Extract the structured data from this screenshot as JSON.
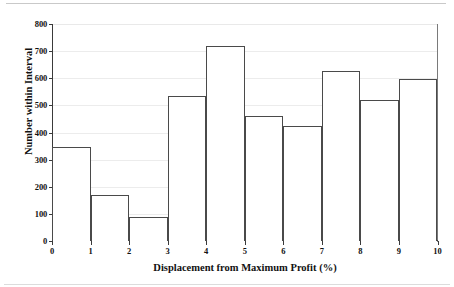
{
  "chart_data": {
    "type": "bar",
    "title": "",
    "subtitle": "",
    "xlabel": "Displacement from Maximum Profit (%)",
    "ylabel": "Number within Interval",
    "xlim": [
      0,
      10
    ],
    "ylim": [
      0,
      800
    ],
    "xticks": [
      "0",
      "1",
      "2",
      "3",
      "4",
      "5",
      "6",
      "7",
      "8",
      "9",
      "10"
    ],
    "yticks": [
      "0",
      "100",
      "200",
      "300",
      "400",
      "500",
      "600",
      "700",
      "800"
    ],
    "grid": "horizontal",
    "legend": "none",
    "bin_width": 1,
    "categories": [
      "0-1",
      "1-2",
      "2-3",
      "3-4",
      "4-5",
      "5-6",
      "6-7",
      "7-8",
      "8-9",
      "9-10"
    ],
    "values": [
      345,
      168,
      90,
      535,
      718,
      460,
      425,
      628,
      520,
      598
    ],
    "bar_edge_color": "#4a4a4a",
    "bar_fill_color": "#ffffff",
    "axis_color": "#3a3a3a",
    "grid_color": "#ececec",
    "text_color": "#111111"
  },
  "axes": {
    "y_tick_values": [
      0,
      100,
      200,
      300,
      400,
      500,
      600,
      700,
      800
    ],
    "x_tick_values": [
      0,
      1,
      2,
      3,
      4,
      5,
      6,
      7,
      8,
      9,
      10
    ]
  }
}
